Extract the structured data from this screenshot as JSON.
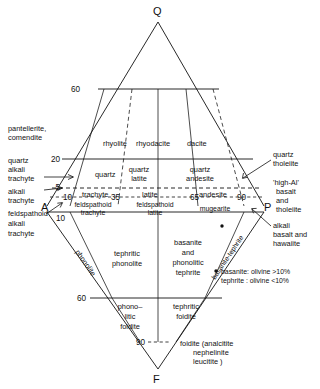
{
  "figure": {
    "type": "qapf-volcanic-classification-diagram",
    "vertices": {
      "q": "Q",
      "a": "A",
      "p": "P",
      "f": "F"
    }
  },
  "ticks": {
    "upper_left_60": "60",
    "upper_left_20": "20",
    "upper_left_5": "5",
    "ap_10": "10",
    "ap_35": "35",
    "ap_65": "65",
    "ap_90": "90",
    "left_10": "10",
    "lower_60": "60",
    "lower_90": "90"
  },
  "fields": {
    "upper": [
      {
        "name": "rhyolite",
        "label": "rhyolite"
      },
      {
        "name": "rhyodacite",
        "label": "rhyodacite"
      },
      {
        "name": "dacite",
        "label": "dacite"
      },
      {
        "name": "quartz",
        "label": "quartz"
      },
      {
        "name": "quartz-latite",
        "line1": "quartz",
        "line2": "latite"
      },
      {
        "name": "quartz-andesite",
        "line1": "quartz",
        "line2": "andesite"
      }
    ],
    "middle": [
      {
        "name": "trachyte",
        "label": "trachyte"
      },
      {
        "name": "latite",
        "label": "latite"
      },
      {
        "name": "andesite",
        "label": "andesite"
      },
      {
        "name": "feldspathoid-trachyte",
        "line1": "feldspathoid",
        "line2": "trachyte"
      },
      {
        "name": "feldspathoid-latite",
        "line1": "feldspathoid",
        "line2": "latite"
      },
      {
        "name": "mugearite",
        "label": "mugearite"
      }
    ],
    "lower": [
      {
        "name": "tephritic-phonolite",
        "line1": "tephritic",
        "line2": "phonolite"
      },
      {
        "name": "basanite-phonolitic-tephrite",
        "line1": "basanite",
        "line2": "and",
        "line3": "phonolitic",
        "line4": "tephrite"
      },
      {
        "name": "phonolitic-foidite",
        "line1": "phono–",
        "line2": "litic",
        "line3": "foidite"
      },
      {
        "name": "tephritic-foidite",
        "line1": "tephritic",
        "line2": "foidite"
      }
    ],
    "edge_rotated": [
      {
        "name": "phonolite",
        "label": "phonolite"
      },
      {
        "name": "basanite-tephrite",
        "label": "basanite-tephrite"
      }
    ]
  },
  "callouts": {
    "left": [
      {
        "name": "pantellerite-comendite",
        "line1": "pantellerite,",
        "line2": "comendite"
      },
      {
        "name": "quartz-alkali-trachyte",
        "line1": "quartz",
        "line2": "alkali",
        "line3": "trachyte"
      },
      {
        "name": "alkali-trachyte",
        "line1": "alkali",
        "line2": "trachyte"
      },
      {
        "name": "feldspathoid-alkali-trachyte",
        "line1": "feldspathoid",
        "line2": "alkali",
        "line3": "trachyte"
      }
    ],
    "right": [
      {
        "name": "quartz-tholeiite",
        "line1": "quartz",
        "line2": "tholeiite"
      },
      {
        "name": "high-al-basalt-and-tholeiite",
        "line1": "'high-Al'",
        "line2": "basalt",
        "line3": "and",
        "line4": "tholeiite"
      },
      {
        "name": "alkali-basalt-and-hawaiite",
        "line1": "alkali",
        "line2": "basalt and",
        "line3": "hawaiite"
      }
    ],
    "bottom": {
      "name": "foidite-note",
      "line1": "foidite (analcitite",
      "line2": "nephelinite",
      "line3": "leucitite )"
    },
    "footnote": {
      "name": "basanite-tephrite-olivine-note",
      "line1": "basanite: olivine >10%",
      "line2": "tephrite : olivine <10%"
    }
  },
  "colors": {
    "ink": "#111111",
    "background": "#ffffff"
  }
}
